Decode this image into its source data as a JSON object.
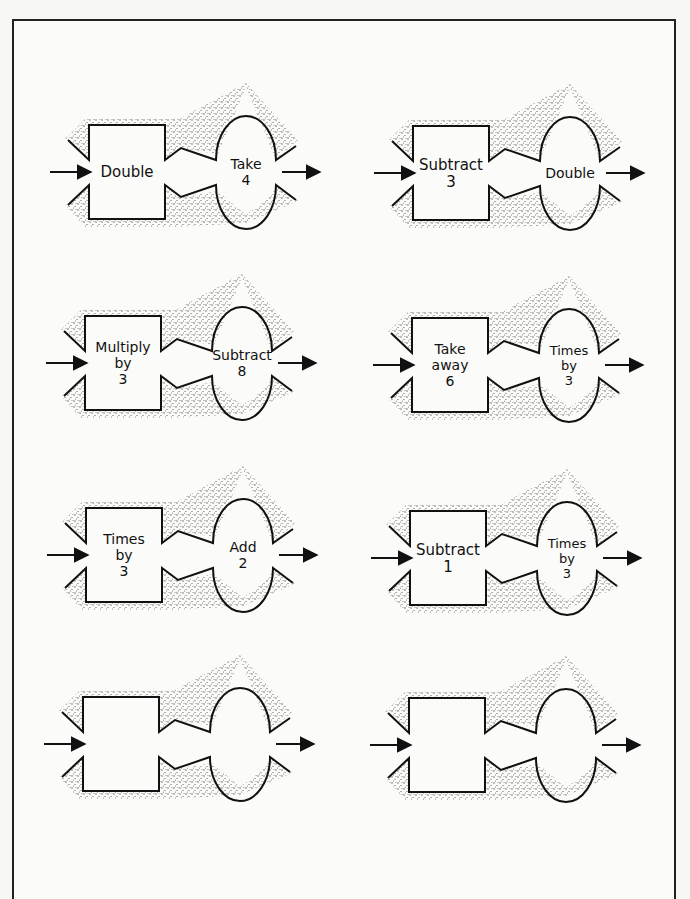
{
  "worksheet": {
    "type": "function-machines",
    "colors": {
      "line": "#111111",
      "stipple": "#333333",
      "paper": "#fbfbf9",
      "border": "#222222"
    },
    "machines": [
      {
        "id": "m1",
        "row": 1,
        "col": "left",
        "x": 89,
        "y": 125,
        "box_label": [
          "Double"
        ],
        "oval_label": [
          "Take",
          "4"
        ]
      },
      {
        "id": "m2",
        "row": 1,
        "col": "right",
        "x": 413,
        "y": 126,
        "box_label": [
          "Subtract",
          "3"
        ],
        "oval_label": [
          "Double"
        ]
      },
      {
        "id": "m3",
        "row": 2,
        "col": "left",
        "x": 85,
        "y": 316,
        "box_label": [
          "Multiply",
          "by",
          "3"
        ],
        "oval_label": [
          "Subtract",
          "8"
        ]
      },
      {
        "id": "m4",
        "row": 2,
        "col": "right",
        "x": 412,
        "y": 318,
        "box_label": [
          "Take",
          "away",
          "6"
        ],
        "oval_label": [
          "Times",
          "by",
          "3"
        ]
      },
      {
        "id": "m5",
        "row": 3,
        "col": "left",
        "x": 86,
        "y": 508,
        "box_label": [
          "Times",
          "by",
          "3"
        ],
        "oval_label": [
          "Add",
          "2"
        ]
      },
      {
        "id": "m6",
        "row": 3,
        "col": "right",
        "x": 410,
        "y": 511,
        "box_label": [
          "Subtract",
          "1"
        ],
        "oval_label": [
          "Times",
          "by",
          "3"
        ]
      },
      {
        "id": "m7",
        "row": 4,
        "col": "left",
        "x": 83,
        "y": 697,
        "box_label": [],
        "oval_label": []
      },
      {
        "id": "m8",
        "row": 4,
        "col": "right",
        "x": 409,
        "y": 698,
        "box_label": [],
        "oval_label": []
      }
    ]
  }
}
